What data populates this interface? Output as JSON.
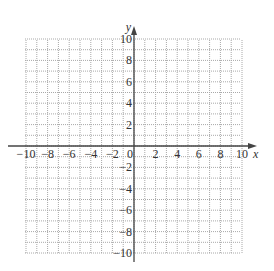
{
  "graph": {
    "x_axis": {
      "label": "x",
      "min": -10,
      "max": 10,
      "step": 1,
      "label_step": 2
    },
    "y_axis": {
      "label": "y",
      "min": -10,
      "max": 10,
      "step": 1,
      "label_step": 2
    },
    "x_tick_labels": [
      "-10",
      "-8",
      "-6",
      "-4",
      "-2",
      "0",
      "2",
      "4",
      "6",
      "8",
      "10"
    ],
    "y_tick_labels_positive": [
      "2",
      "4",
      "6",
      "8",
      "10"
    ],
    "y_tick_labels_negative": [
      "-2",
      "-4",
      "-6",
      "-8",
      "-10"
    ],
    "colors": {
      "grid": "#a8a8a8",
      "axis": "#444444",
      "text": "#333333",
      "background": "#ffffff"
    }
  }
}
